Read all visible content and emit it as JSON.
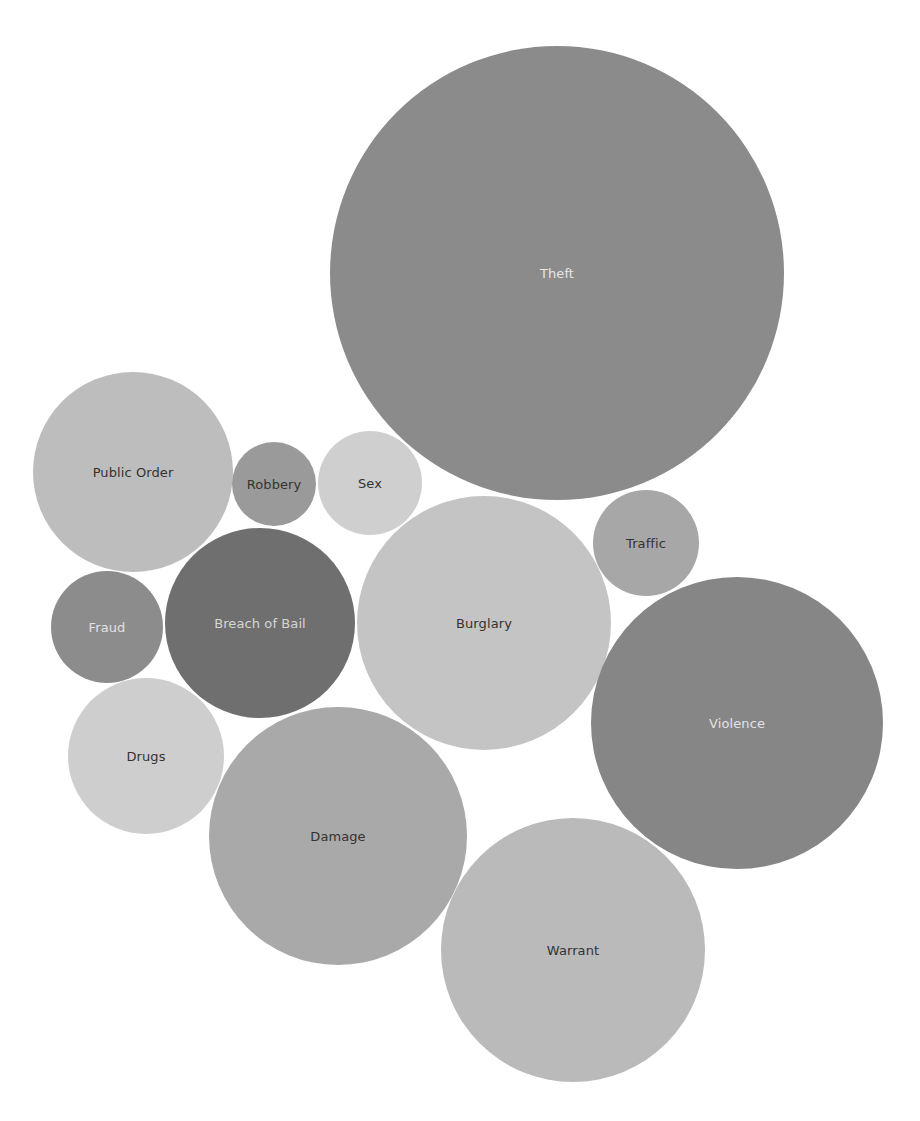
{
  "chart_data": {
    "type": "packed-bubble",
    "title": "",
    "xlabel": "",
    "ylabel": "",
    "grid": false,
    "legend": null,
    "size_encoding": "relative offence count (estimated from bubble area, Theft = 100)",
    "categories": [
      "Theft",
      "Violence",
      "Warrant",
      "Damage",
      "Burglary",
      "Public Order",
      "Breach of Bail",
      "Drugs",
      "Fraud",
      "Traffic",
      "Sex",
      "Robbery"
    ],
    "values": [
      100,
      41,
      34,
      32,
      31,
      19,
      18,
      12,
      6,
      5,
      5,
      3
    ],
    "bubbles": [
      {
        "label": "Theft",
        "cx": 557,
        "cy": 273,
        "r": 227,
        "fill": "#8b8b8b",
        "text": "#e6e6e6",
        "value": 100
      },
      {
        "label": "Public Order",
        "cx": 133,
        "cy": 472,
        "r": 100,
        "fill": "#bdbdbd",
        "text": "#333333",
        "value": 19
      },
      {
        "label": "Robbery",
        "cx": 274,
        "cy": 484,
        "r": 42,
        "fill": "#9a9a9a",
        "text": "#333333",
        "value": 3
      },
      {
        "label": "Sex",
        "cx": 370,
        "cy": 483,
        "r": 52,
        "fill": "#cfcfcf",
        "text": "#333333",
        "value": 5
      },
      {
        "label": "Traffic",
        "cx": 646,
        "cy": 543,
        "r": 53,
        "fill": "#a7a7a7",
        "text": "#333333",
        "value": 5
      },
      {
        "label": "Fraud",
        "cx": 107,
        "cy": 627,
        "r": 56,
        "fill": "#8c8c8c",
        "text": "#e2e2e2",
        "value": 6
      },
      {
        "label": "Breach of Bail",
        "cx": 260,
        "cy": 623,
        "r": 95,
        "fill": "#6f6f6f",
        "text": "#d6d6d6",
        "value": 18
      },
      {
        "label": "Burglary",
        "cx": 484,
        "cy": 623,
        "r": 127,
        "fill": "#c4c4c4",
        "text": "#333333",
        "value": 31
      },
      {
        "label": "Violence",
        "cx": 737,
        "cy": 723,
        "r": 146,
        "fill": "#868686",
        "text": "#e2e2e2",
        "value": 41
      },
      {
        "label": "Drugs",
        "cx": 146,
        "cy": 756,
        "r": 78,
        "fill": "#cecece",
        "text": "#333333",
        "value": 12
      },
      {
        "label": "Damage",
        "cx": 338,
        "cy": 836,
        "r": 129,
        "fill": "#a9a9a9",
        "text": "#333333",
        "value": 32
      },
      {
        "label": "Warrant",
        "cx": 573,
        "cy": 950,
        "r": 132,
        "fill": "#bababa",
        "text": "#333333",
        "value": 34
      }
    ]
  }
}
